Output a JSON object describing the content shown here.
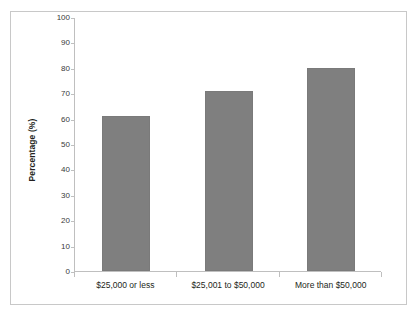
{
  "chart_data": {
    "type": "bar",
    "title": "",
    "subtitle": "",
    "xlabel": "",
    "ylabel": "Percentage (%)",
    "categories": [
      "$25,000 or less",
      "$25,001 to $50,000",
      "More than $50,000"
    ],
    "values": [
      61,
      71,
      80
    ],
    "series": [
      {
        "name": "Percentage",
        "values": [
          61,
          71,
          80
        ]
      }
    ],
    "ylim": [
      0,
      100
    ],
    "ytick_step": 10,
    "yticks": [
      100,
      90,
      80,
      70,
      60,
      50,
      40,
      30,
      20,
      10,
      0
    ],
    "ytick_labels": [
      "100",
      "90",
      "80",
      "70",
      "60",
      "50",
      "40",
      "30",
      "20",
      "10",
      "0"
    ],
    "grid": false,
    "legend": false,
    "legend_position": "none",
    "annotations": [],
    "bar_color": "#7f7f7f",
    "axis_color": "#bfbfbf",
    "text_color": "#231f20",
    "frame_color": "#c8c8c8",
    "background_color": "#ffffff"
  }
}
